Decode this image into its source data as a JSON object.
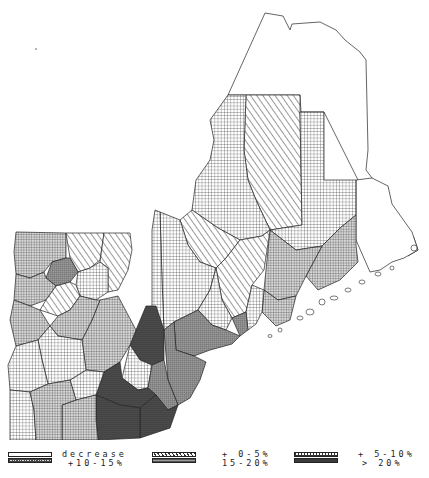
{
  "map": {
    "title": "",
    "region": "Northern New England counties (Vermont, New Hampshire, Maine)",
    "measure": "Population change by county",
    "pattern_fills": {
      "decrease": "blank",
      "plus_0_5": "diagonal-hatch",
      "plus_5_10": "coarse-grid",
      "plus_10_15": "fine-grid",
      "plus_15_20": "dense-grid-gray",
      "over_20": "dark-dense"
    }
  },
  "legend": {
    "items": [
      {
        "id": "decrease",
        "label": "decrease",
        "pattern": "blank"
      },
      {
        "id": "plus_0_5",
        "label": "+ 0-5%",
        "pattern": "diagonal-hatch"
      },
      {
        "id": "plus_5_10",
        "label": "+ 5-10%",
        "pattern": "coarse-grid"
      },
      {
        "id": "plus_10_15",
        "label": "+10-15%",
        "pattern": "fine-grid"
      },
      {
        "id": "plus_15_20",
        "label": "15-20%",
        "pattern": "dense-grid-gray"
      },
      {
        "id": "over_20",
        "label": "> 20%",
        "pattern": "dark-dense"
      }
    ],
    "row1": [
      "decrease",
      "+ 0-5%",
      "+ 5-10%"
    ],
    "row2": [
      "+10-15%",
      "15-20%",
      "> 20%"
    ]
  }
}
